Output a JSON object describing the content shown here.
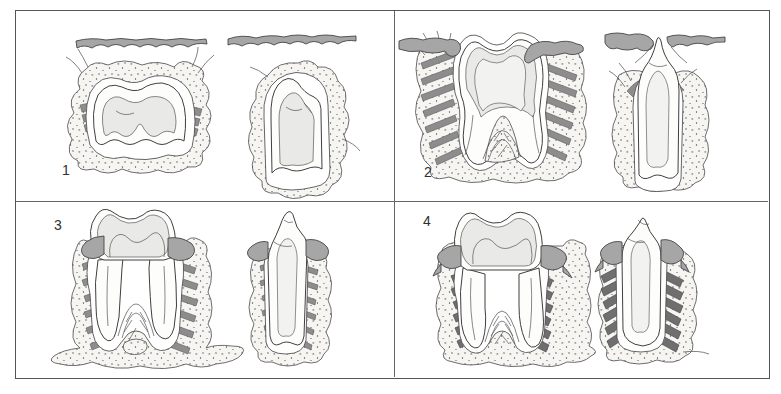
{
  "figure": {
    "panels": [
      {
        "label": "1"
      },
      {
        "label": "2"
      },
      {
        "label": "3"
      },
      {
        "label": "4"
      }
    ],
    "colors": {
      "background": "#ffffff",
      "frame_border": "#555555",
      "gingiva_gray": "#a6a6a6",
      "ligament_gray": "#8d8d8d",
      "ligament_dark_gray": "#6f6f6f",
      "dentin_gray": "#e9e9e7",
      "pulp_gray": "#f2f2f0",
      "bone_stipple_bg": "#f6f5f2",
      "line_color": "#3f3f3f"
    }
  }
}
